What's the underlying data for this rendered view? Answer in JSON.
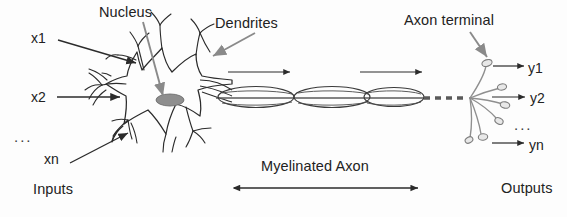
{
  "figure": {
    "kind": "neuron-diagram",
    "background_color": "#fdfdfd",
    "ink_color": "#2b2b2b",
    "accent_gray": "#8a8a8a",
    "nucleus_fill": "#8e8e8e"
  },
  "annotations": {
    "nucleus": "Nucleus",
    "dendrites": "Dendrites",
    "axon_terminal": "Axon terminal",
    "myelinated_axon": "Myelinated Axon"
  },
  "inputs": {
    "caption": "Inputs",
    "items": [
      "x1",
      "x2",
      "xn"
    ],
    "ellipsis": "..."
  },
  "outputs": {
    "caption": "Outputs",
    "items": [
      "y1",
      "y2",
      "yn"
    ],
    "ellipsis": "..."
  }
}
